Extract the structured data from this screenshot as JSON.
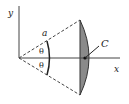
{
  "diagram": {
    "type": "circular-segment-centroid",
    "labels": {
      "y_axis": "y",
      "x_axis": "x",
      "radius": "a",
      "angle_upper": "θ",
      "angle_lower": "θ",
      "centroid": "C"
    },
    "colors": {
      "line": "#333333",
      "fill": "#8a8a8a",
      "background": "#ffffff"
    }
  }
}
